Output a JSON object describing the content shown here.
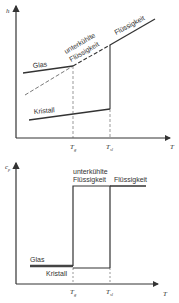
{
  "top_chart": {
    "y_axis_label": "h",
    "x_axis_label": "T",
    "ticks": [
      {
        "main": "T",
        "sub": "g"
      },
      {
        "main": "T",
        "sub": "sl"
      }
    ],
    "labels": {
      "glass": "Glas",
      "supercooled_line1": "unterkühlte",
      "supercooled_line2": "Flüssigkeit",
      "liquid": "Flüssigkeit",
      "crystal": "Kristall"
    }
  },
  "bottom_chart": {
    "y_axis_label": "c",
    "y_axis_sub": "p",
    "x_axis_label": "T",
    "ticks": [
      {
        "main": "T",
        "sub": "g"
      },
      {
        "main": "T",
        "sub": "sl"
      }
    ],
    "labels": {
      "supercooled_line1": "unterkühlte",
      "supercooled_line2": "Flüssigkeit",
      "liquid": "Flüssigkeit",
      "glass": "Glas",
      "crystal": "Kristall"
    }
  },
  "colors": {
    "line": "#333333",
    "background": "#ffffff"
  }
}
